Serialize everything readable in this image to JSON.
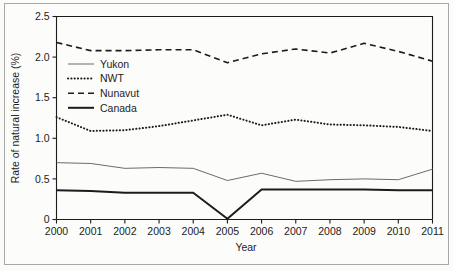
{
  "chart_data": {
    "type": "line",
    "title": "",
    "xlabel": "Year",
    "ylabel": "Rate of natural increase (%)",
    "x": [
      2000,
      2001,
      2002,
      2003,
      2004,
      2005,
      2006,
      2007,
      2008,
      2009,
      2010,
      2011
    ],
    "categories": [
      "2000",
      "2001",
      "2002",
      "2003",
      "2004",
      "2005",
      "2006",
      "2007",
      "2008",
      "2009",
      "2010",
      "2011"
    ],
    "xlim": [
      2000,
      2011
    ],
    "ylim": [
      0,
      2.5
    ],
    "yticks": [
      0,
      0.5,
      1.0,
      1.5,
      2.0,
      2.5
    ],
    "ytick_labels": [
      "0",
      "0.5",
      "1.0",
      "1.5",
      "2.0",
      "2.5"
    ],
    "grid": false,
    "legend_position": "upper left",
    "series": [
      {
        "name": "Yukon",
        "style": "solid-thin",
        "color": "#6b6b6b",
        "values": [
          0.7,
          0.69,
          0.63,
          0.64,
          0.63,
          0.48,
          0.57,
          0.47,
          0.49,
          0.5,
          0.49,
          0.62
        ]
      },
      {
        "name": "NWT",
        "style": "dotted",
        "color": "#1c1c1c",
        "values": [
          1.26,
          1.09,
          1.1,
          1.15,
          1.22,
          1.29,
          1.16,
          1.23,
          1.17,
          1.16,
          1.14,
          1.09
        ]
      },
      {
        "name": "Nunavut",
        "style": "dashed",
        "color": "#1c1c1c",
        "values": [
          2.18,
          2.08,
          2.08,
          2.09,
          2.09,
          1.93,
          2.04,
          2.1,
          2.05,
          2.17,
          2.07,
          1.95
        ]
      },
      {
        "name": "Canada",
        "style": "solid-thick",
        "color": "#1c1c1c",
        "values": [
          0.36,
          0.35,
          0.33,
          0.33,
          0.33,
          0.01,
          0.37,
          0.37,
          0.37,
          0.37,
          0.36,
          0.36
        ]
      }
    ]
  },
  "legend": {
    "items": [
      {
        "label": "Yukon"
      },
      {
        "label": "NWT"
      },
      {
        "label": "Nunavut"
      },
      {
        "label": "Canada"
      }
    ]
  },
  "axes": {
    "x_title": "Year",
    "y_title": "Rate of natural increase (%)"
  }
}
